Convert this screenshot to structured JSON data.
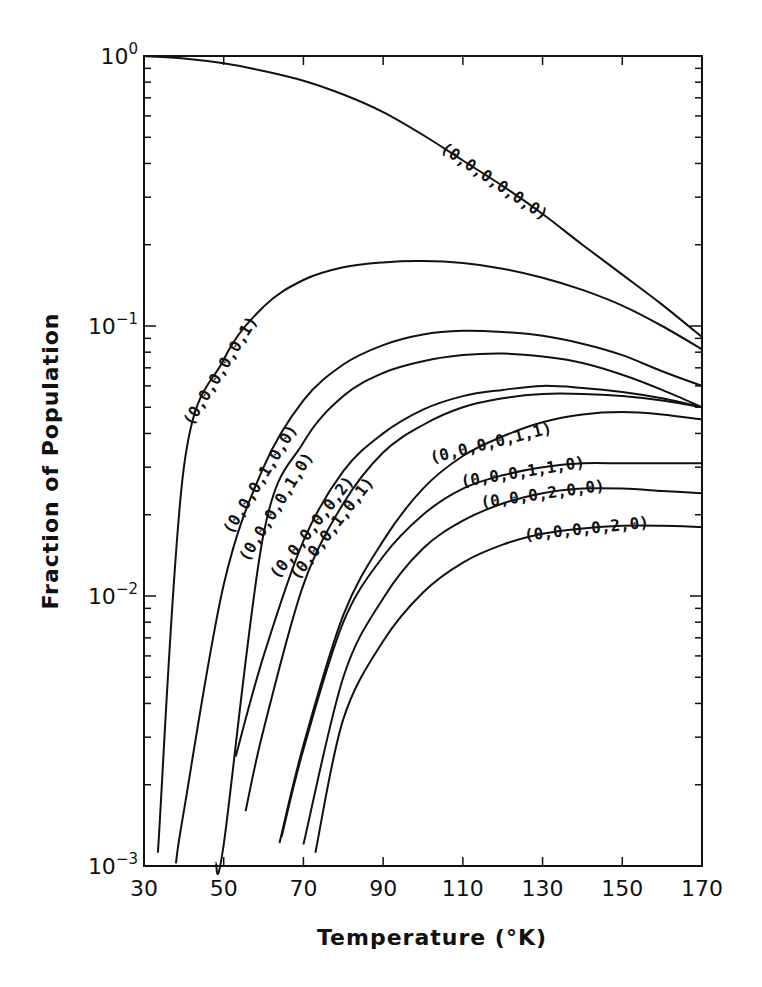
{
  "chart_data": {
    "type": "line",
    "title": "",
    "xlabel": "Temperature (°K)",
    "ylabel": "Fraction of Population",
    "xlim": [
      30,
      170
    ],
    "ylim": [
      0.001,
      1
    ],
    "yscale": "log",
    "grid": false,
    "legend": "inline labels on curves",
    "x_ticks": [
      "30",
      "50",
      "70",
      "90",
      "110",
      "130",
      "150",
      "170"
    ],
    "y_ticks": [
      "10^0",
      "10^-1",
      "10^-2",
      "10^-3"
    ],
    "x": [
      30,
      40,
      50,
      60,
      70,
      80,
      90,
      100,
      110,
      120,
      130,
      140,
      150,
      160,
      170
    ],
    "series": [
      {
        "name": "(0,0,0,0,0,0)",
        "values": [
          1.0,
          0.98,
          0.94,
          0.88,
          0.81,
          0.72,
          0.62,
          0.51,
          0.41,
          0.33,
          0.26,
          0.2,
          0.155,
          0.12,
          0.091
        ]
      },
      {
        "name": "(0,0,0,0,0,1)",
        "values": [
          0.0032,
          0.03,
          0.075,
          0.118,
          0.148,
          0.165,
          0.172,
          0.174,
          0.171,
          0.163,
          0.151,
          0.136,
          0.119,
          0.1,
          0.082
        ]
      },
      {
        "name": "(0,0,0,1,0,0)",
        "values": [
          null,
          0.0016,
          0.011,
          0.03,
          0.053,
          0.072,
          0.085,
          0.093,
          0.096,
          0.095,
          0.092,
          0.086,
          0.078,
          0.068,
          0.06
        ]
      },
      {
        "name": "(0,0,0,0,1,0)",
        "values": [
          null,
          null,
          0.0012,
          0.017,
          0.037,
          0.055,
          0.067,
          0.074,
          0.078,
          0.079,
          0.077,
          0.073,
          0.066,
          0.058,
          0.05
        ]
      },
      {
        "name": "(0,0,0,0,0,2)",
        "values": [
          null,
          null,
          null,
          0.006,
          0.016,
          0.029,
          0.04,
          0.049,
          0.055,
          0.058,
          0.06,
          0.059,
          0.057,
          0.054,
          0.05
        ]
      },
      {
        "name": "(0,0,0,1,0,1)",
        "values": [
          null,
          null,
          null,
          0.0032,
          0.011,
          0.022,
          0.034,
          0.043,
          0.05,
          0.054,
          0.056,
          0.056,
          0.055,
          0.053,
          0.05
        ]
      },
      {
        "name": "(0,0,0,0,1,1)",
        "values": [
          null,
          null,
          null,
          null,
          0.0028,
          0.0085,
          0.016,
          0.025,
          0.033,
          0.039,
          0.044,
          0.047,
          0.048,
          0.047,
          0.045
        ]
      },
      {
        "name": "(0,0,0,1,1,0)",
        "values": [
          null,
          null,
          null,
          null,
          0.0027,
          0.008,
          0.014,
          0.02,
          0.025,
          0.028,
          0.03,
          0.031,
          0.031,
          0.031,
          0.031
        ]
      },
      {
        "name": "(0,0,0,2,0,0)",
        "values": [
          null,
          null,
          null,
          null,
          0.0012,
          0.005,
          0.0098,
          0.015,
          0.019,
          0.022,
          0.024,
          0.025,
          0.025,
          0.0245,
          0.024
        ]
      },
      {
        "name": "(0,0,0,0,2,0)",
        "values": [
          null,
          null,
          null,
          null,
          0.001,
          0.0035,
          0.0068,
          0.0103,
          0.0133,
          0.0155,
          0.017,
          0.0178,
          0.0182,
          0.0182,
          0.018
        ]
      }
    ],
    "series_start_x": [
      30,
      33.5,
      38,
      48,
      53,
      55.5,
      64,
      64.5,
      70,
      73
    ],
    "label_positions": [
      {
        "series": 0,
        "x": 118,
        "angle": 34
      },
      {
        "series": 1,
        "x": 49,
        "angle": -58
      },
      {
        "series": 2,
        "x": 59,
        "angle": -58
      },
      {
        "series": 3,
        "x": 63,
        "angle": -58
      },
      {
        "series": 4,
        "x": 72,
        "angle": -52
      },
      {
        "series": 5,
        "x": 77,
        "angle": -52
      },
      {
        "series": 6,
        "x": 117,
        "angle": -14
      },
      {
        "series": 7,
        "x": 125,
        "angle": -9
      },
      {
        "series": 8,
        "x": 130,
        "angle": -8
      },
      {
        "series": 9,
        "x": 141,
        "angle": -6
      }
    ]
  },
  "axes": {
    "x_title": "Temperature (°K)",
    "y_title": "Fraction of Population",
    "y_tick_base": "10",
    "y_tick_exponents": [
      "0",
      "-1",
      "-2",
      "-3"
    ]
  }
}
